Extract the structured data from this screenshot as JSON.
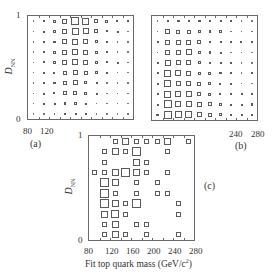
{
  "chart_data": [
    {
      "type": "heatmap",
      "subtype": "box-size matrix",
      "panel_label": "(a)",
      "ylabel": "D_NN",
      "xlabel": "",
      "x_ticks": [
        "80",
        "120"
      ],
      "y_ticks": [
        "0",
        "1"
      ],
      "ylim": [
        0,
        1
      ],
      "xlim": [
        80,
        280
      ],
      "grid_rows": 10,
      "grid_cols": 10,
      "rows_top_to_bottom": [
        [
          0.5,
          1.5,
          3,
          5,
          8,
          7,
          4,
          3,
          2,
          1.5
        ],
        [
          0.5,
          1.5,
          3,
          5,
          7,
          6,
          4,
          2,
          1.5,
          1
        ],
        [
          0.5,
          1.5,
          2.5,
          5,
          6,
          5,
          3,
          1.5,
          1,
          0.5
        ],
        [
          1,
          1.5,
          3,
          5,
          6,
          5,
          3,
          1.5,
          1,
          0.5
        ],
        [
          1,
          2,
          3,
          5,
          6,
          5,
          3,
          2,
          1.5,
          1
        ],
        [
          1,
          1.5,
          2,
          4,
          5,
          4,
          3,
          1.5,
          1,
          1
        ],
        [
          0.5,
          1.5,
          2.5,
          4,
          5,
          3,
          1.5,
          1,
          0.5,
          0.5
        ],
        [
          0.5,
          1.5,
          2,
          4,
          4,
          3,
          1.5,
          1,
          0.5,
          0.5
        ],
        [
          0.5,
          1.5,
          1.5,
          2.5,
          2.5,
          1.5,
          1,
          0.5,
          0.5,
          0.5
        ],
        [
          1,
          1,
          0.5,
          1.5,
          1.5,
          1.5,
          1,
          0.5,
          0.5,
          0.5
        ]
      ]
    },
    {
      "type": "heatmap",
      "subtype": "box-size matrix",
      "panel_label": "(b)",
      "ylabel": "",
      "xlabel": "",
      "x_ticks": [
        "240",
        "280"
      ],
      "y_ticks": [],
      "ylim": [
        0,
        1
      ],
      "xlim": [
        80,
        280
      ],
      "grid_rows": 10,
      "grid_cols": 10,
      "rows_top_to_bottom": [
        [
          0.5,
          2.5,
          2.5,
          2.5,
          2.5,
          1.5,
          1.5,
          1.5,
          1,
          0.5
        ],
        [
          1,
          5,
          4,
          4,
          3,
          2.5,
          2.5,
          1,
          0.5,
          0.5
        ],
        [
          1.5,
          5,
          5,
          5,
          4,
          2,
          1.5,
          1.5,
          2,
          1.5
        ],
        [
          1,
          5,
          5,
          6,
          3,
          2.5,
          1.5,
          1,
          1,
          0.5
        ],
        [
          1.5,
          6,
          5,
          5,
          3,
          2.5,
          1.5,
          1.5,
          0.5,
          1
        ],
        [
          1.5,
          7,
          6,
          5,
          3,
          3,
          2.5,
          1.5,
          1,
          1.5
        ],
        [
          1.5,
          7,
          5,
          5,
          4,
          3,
          2,
          1.5,
          1,
          1
        ],
        [
          1.5,
          7,
          6,
          6,
          4,
          3,
          2,
          2,
          1.5,
          1.5
        ],
        [
          1.5,
          8,
          6,
          6,
          5,
          4,
          3,
          1.5,
          1.5,
          2.5
        ],
        [
          2.5,
          8,
          7,
          7,
          5,
          4,
          3,
          1.5,
          1.5,
          1.5
        ]
      ]
    },
    {
      "type": "heatmap",
      "subtype": "box-size matrix",
      "panel_label": "(c)",
      "ylabel": "D_NN",
      "xlabel": "Fit top quark mass (GeV/c^2)",
      "x_ticks": [
        "80",
        "120",
        "160",
        "200",
        "240",
        "280"
      ],
      "y_ticks": [
        "0",
        "1"
      ],
      "ylim": [
        0,
        1
      ],
      "xlim": [
        80,
        280
      ],
      "grid_rows": 10,
      "grid_cols": 10,
      "rows_top_to_bottom": [
        [
          0,
          0,
          5,
          7,
          5,
          5,
          5,
          7,
          0,
          5
        ],
        [
          0,
          5,
          7,
          5,
          9,
          0,
          0,
          5,
          0,
          0
        ],
        [
          0,
          5,
          0,
          0,
          7,
          5,
          0,
          0,
          0,
          0
        ],
        [
          5,
          5,
          7,
          9,
          7,
          5,
          0,
          5,
          0,
          0
        ],
        [
          0,
          9,
          7,
          0,
          5,
          0,
          5,
          0,
          0,
          0
        ],
        [
          0,
          9,
          5,
          0,
          5,
          0,
          5,
          5,
          0,
          0
        ],
        [
          0,
          9,
          7,
          5,
          9,
          0,
          0,
          0,
          5,
          0
        ],
        [
          0,
          7,
          8,
          5,
          0,
          0,
          0,
          0,
          5,
          0
        ],
        [
          0,
          5,
          7,
          0,
          5,
          5,
          0,
          0,
          0,
          0
        ],
        [
          0,
          5,
          7,
          5,
          0,
          5,
          0,
          0,
          5,
          0
        ]
      ]
    }
  ],
  "labels": {
    "a": "(a)",
    "b": "(b)",
    "c": "(c)",
    "y_one": "1",
    "y_zero": "0",
    "ylabel_main": "D",
    "ylabel_sub": "NN",
    "a_x80": "80",
    "a_x120": "120",
    "b_x240": "240",
    "b_x280": "280",
    "c_xticks": [
      "80",
      "120",
      "160",
      "200",
      "240",
      "280"
    ],
    "xlabel_text": "Fit top quark mass (GeV/c",
    "xlabel_sup": "2",
    "xlabel_close": ")"
  },
  "colors": {
    "frame": "#6a6a6a",
    "box": "#5a5a5a",
    "text": "#333333"
  }
}
